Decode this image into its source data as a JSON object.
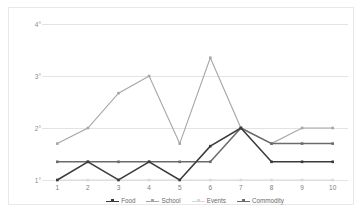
{
  "chart_data": {
    "type": "line",
    "title": "",
    "subtitle": "",
    "xlabel": "",
    "ylabel": "",
    "x": [
      1,
      2,
      3,
      4,
      5,
      6,
      7,
      8,
      9,
      10
    ],
    "categories": [
      "1",
      "2",
      "3",
      "4",
      "5",
      "6",
      "7",
      "8",
      "9",
      "10"
    ],
    "ylim": [
      1,
      4
    ],
    "yticks": [
      1,
      2,
      3,
      4
    ],
    "ytick_labels": [
      "1°",
      "2°",
      "3°",
      "4°"
    ],
    "grid": true,
    "legend_position": "bottom",
    "series": [
      {
        "name": "Food",
        "color": "#3a3a3a",
        "marker": "square",
        "values": [
          1.0,
          1.35,
          1.0,
          1.35,
          1.0,
          1.65,
          2.0,
          1.35,
          1.35,
          1.35
        ]
      },
      {
        "name": "School",
        "color": "#a6a6a6",
        "marker": "square",
        "values": [
          1.7,
          2.0,
          2.67,
          3.0,
          1.7,
          3.35,
          2.0,
          1.7,
          2.0,
          2.0
        ]
      },
      {
        "name": "Events",
        "color": "#d9d9d9",
        "marker": "square",
        "values": [
          1.0,
          1.0,
          1.0,
          1.0,
          1.0,
          1.0,
          1.0,
          1.0,
          1.0,
          1.0
        ]
      },
      {
        "name": "Commodity",
        "color": "#6b6b6b",
        "marker": "square",
        "values": [
          1.35,
          1.35,
          1.35,
          1.35,
          1.35,
          1.35,
          2.0,
          1.7,
          1.7,
          1.7
        ]
      }
    ]
  },
  "legend": {
    "items": [
      {
        "label": "Food"
      },
      {
        "label": "School"
      },
      {
        "label": "Events"
      },
      {
        "label": "Commodity"
      }
    ]
  },
  "colors": {
    "frame_border": "#e8e8e8",
    "gridline": "#e3e3e3",
    "background": "#ffffff",
    "tick_text": "#8c8c8c"
  }
}
